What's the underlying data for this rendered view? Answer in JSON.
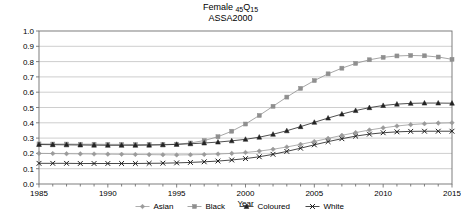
{
  "chart_data": {
    "type": "line",
    "title": "Female 45Q15",
    "title_main": "Female",
    "title_sub_pre": "45",
    "title_sub_post": "15",
    "title_q": "Q",
    "subtitle": "ASSA2000",
    "xlabel": "Year",
    "ylabel": "",
    "xlim": [
      1985,
      2015
    ],
    "ylim": [
      0.0,
      1.0
    ],
    "grid": true,
    "legend_position": "bottom",
    "xticks": [
      1985,
      1990,
      1995,
      2000,
      2005,
      2010,
      2015
    ],
    "xtick_labels": [
      "1985",
      "1990",
      "1995",
      "2000",
      "2005",
      "2010",
      "2015"
    ],
    "yticks": [
      0.0,
      0.1,
      0.2,
      0.3,
      0.4,
      0.5,
      0.6,
      0.7,
      0.8,
      0.9,
      1.0
    ],
    "ytick_labels": [
      "0.0",
      "0.1",
      "0.2",
      "0.3",
      "0.4",
      "0.5",
      "0.6",
      "0.7",
      "0.8",
      "0.9",
      "1.0"
    ],
    "x": [
      1985,
      1986,
      1987,
      1988,
      1989,
      1990,
      1991,
      1992,
      1993,
      1994,
      1995,
      1996,
      1997,
      1998,
      1999,
      2000,
      2001,
      2002,
      2003,
      2004,
      2005,
      2006,
      2007,
      2008,
      2009,
      2010,
      2011,
      2012,
      2013,
      2014,
      2015
    ],
    "series": [
      {
        "name": "Asian",
        "marker": "diamond",
        "color": "#9a9a9a",
        "values": [
          0.2,
          0.199,
          0.198,
          0.197,
          0.196,
          0.195,
          0.194,
          0.193,
          0.192,
          0.191,
          0.19,
          0.191,
          0.193,
          0.196,
          0.2,
          0.206,
          0.215,
          0.227,
          0.242,
          0.259,
          0.278,
          0.298,
          0.318,
          0.336,
          0.353,
          0.367,
          0.379,
          0.388,
          0.394,
          0.398,
          0.4
        ]
      },
      {
        "name": "Black",
        "marker": "square",
        "color": "#8f8f8f",
        "values": [
          0.262,
          0.261,
          0.261,
          0.26,
          0.26,
          0.259,
          0.259,
          0.258,
          0.258,
          0.258,
          0.26,
          0.268,
          0.284,
          0.309,
          0.345,
          0.392,
          0.448,
          0.508,
          0.568,
          0.625,
          0.676,
          0.72,
          0.757,
          0.788,
          0.812,
          0.828,
          0.837,
          0.84,
          0.838,
          0.83,
          0.815
        ]
      },
      {
        "name": "Coloured",
        "marker": "triangle",
        "color": "#232323",
        "values": [
          0.258,
          0.257,
          0.256,
          0.255,
          0.254,
          0.253,
          0.253,
          0.253,
          0.254,
          0.256,
          0.259,
          0.263,
          0.268,
          0.274,
          0.282,
          0.292,
          0.306,
          0.325,
          0.348,
          0.375,
          0.403,
          0.431,
          0.457,
          0.48,
          0.499,
          0.513,
          0.522,
          0.527,
          0.529,
          0.529,
          0.528
        ]
      },
      {
        "name": "White",
        "marker": "x",
        "color": "#1a1a1a",
        "values": [
          0.135,
          0.135,
          0.135,
          0.134,
          0.134,
          0.134,
          0.134,
          0.134,
          0.135,
          0.136,
          0.138,
          0.141,
          0.145,
          0.15,
          0.157,
          0.166,
          0.178,
          0.194,
          0.213,
          0.234,
          0.256,
          0.277,
          0.296,
          0.313,
          0.326,
          0.335,
          0.341,
          0.344,
          0.345,
          0.345,
          0.345
        ]
      }
    ],
    "legend_entries": [
      "Asian",
      "Black",
      "Coloured",
      "White"
    ]
  }
}
